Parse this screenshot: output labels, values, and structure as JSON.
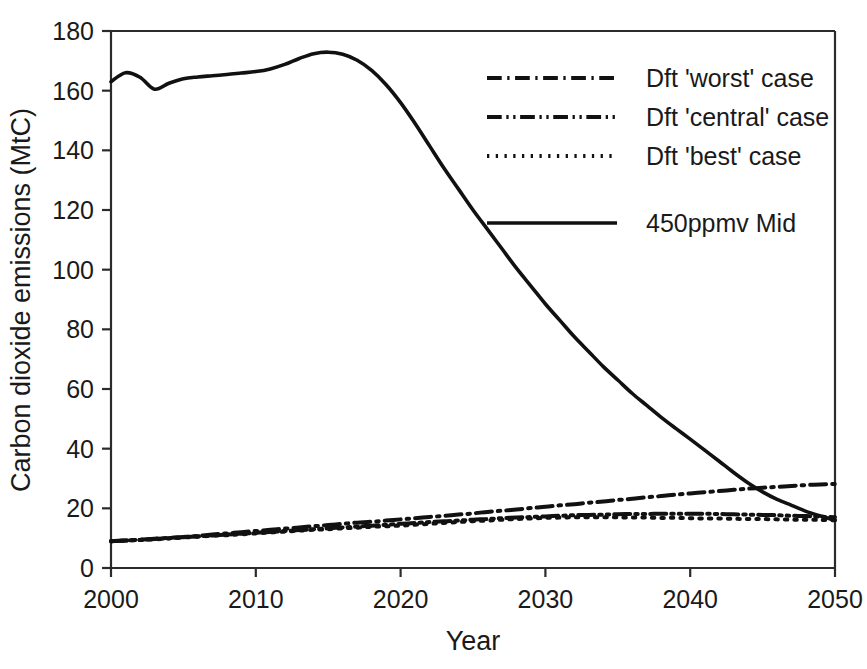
{
  "chart_data": {
    "type": "line",
    "title": "",
    "xlabel": "Year",
    "ylabel": "Carbon dioxide emissions (MtC)",
    "xlim": [
      2000,
      2050
    ],
    "ylim": [
      0,
      180
    ],
    "xticks": [
      2000,
      2010,
      2020,
      2030,
      2040,
      2050
    ],
    "xtick_labels": [
      "2000",
      "2010",
      "2020",
      "2030",
      "2040",
      "2050"
    ],
    "yticks": [
      0,
      20,
      40,
      60,
      80,
      100,
      120,
      140,
      160,
      180
    ],
    "ytick_labels": [
      "0",
      "20",
      "40",
      "60",
      "80",
      "100",
      "120",
      "140",
      "160",
      "180"
    ],
    "grid": false,
    "legend_position": "upper right",
    "x": [
      2000,
      2001,
      2002,
      2003,
      2004,
      2005,
      2006,
      2007,
      2008,
      2009,
      2010,
      2011,
      2012,
      2013,
      2014,
      2015,
      2016,
      2017,
      2018,
      2019,
      2020,
      2021,
      2022,
      2023,
      2024,
      2025,
      2026,
      2027,
      2028,
      2029,
      2030,
      2031,
      2032,
      2033,
      2034,
      2035,
      2036,
      2037,
      2038,
      2039,
      2040,
      2041,
      2042,
      2043,
      2044,
      2045,
      2046,
      2047,
      2048,
      2049,
      2050
    ],
    "series": [
      {
        "name": "Dft 'worst' case",
        "style": "dash-dot",
        "color": "#111111",
        "values": [
          9.0,
          9.2,
          9.5,
          9.8,
          10.1,
          10.4,
          10.8,
          11.2,
          11.6,
          12.0,
          12.4,
          12.8,
          13.2,
          13.6,
          14.0,
          14.4,
          14.8,
          15.2,
          15.5,
          15.9,
          16.3,
          16.7,
          17.1,
          17.5,
          17.9,
          18.3,
          18.8,
          19.2,
          19.6,
          20.1,
          20.5,
          21.0,
          21.4,
          21.9,
          22.3,
          22.8,
          23.2,
          23.7,
          24.1,
          24.6,
          25.0,
          25.4,
          25.8,
          26.2,
          26.6,
          26.9,
          27.2,
          27.5,
          27.8,
          28.0,
          28.2
        ]
      },
      {
        "name": "Dft 'central' case",
        "style": "dash-dot-dot",
        "color": "#111111",
        "values": [
          9.0,
          9.2,
          9.4,
          9.7,
          10.0,
          10.3,
          10.6,
          10.9,
          11.2,
          11.5,
          11.8,
          12.1,
          12.4,
          12.7,
          13.0,
          13.3,
          13.6,
          13.9,
          14.2,
          14.5,
          14.8,
          15.1,
          15.4,
          15.7,
          15.9,
          16.2,
          16.4,
          16.7,
          16.9,
          17.1,
          17.3,
          17.5,
          17.7,
          17.8,
          17.9,
          18.0,
          18.1,
          18.1,
          18.2,
          18.2,
          18.2,
          18.2,
          18.1,
          18.0,
          17.9,
          17.8,
          17.7,
          17.5,
          17.4,
          17.2,
          17.0
        ]
      },
      {
        "name": "Dft 'best' case",
        "style": "dotted",
        "color": "#111111",
        "values": [
          9.0,
          9.2,
          9.4,
          9.6,
          9.9,
          10.2,
          10.5,
          10.8,
          11.0,
          11.3,
          11.6,
          11.9,
          12.2,
          12.5,
          12.8,
          13.0,
          13.3,
          13.5,
          13.8,
          14.0,
          14.2,
          14.5,
          14.8,
          15.1,
          15.4,
          15.7,
          15.9,
          16.2,
          16.4,
          16.6,
          16.8,
          16.9,
          17.0,
          17.0,
          17.0,
          17.0,
          16.9,
          16.9,
          16.8,
          16.8,
          16.7,
          16.6,
          16.6,
          16.5,
          16.4,
          16.4,
          16.3,
          16.2,
          16.2,
          16.1,
          16.0
        ]
      },
      {
        "name": "450ppmv Mid",
        "style": "solid",
        "color": "#111111",
        "values": [
          163.0,
          166.0,
          164.5,
          160.5,
          162.5,
          164.0,
          164.6,
          165.0,
          165.4,
          165.9,
          166.4,
          167.3,
          168.8,
          170.8,
          172.4,
          172.9,
          172.2,
          170.2,
          166.8,
          162.0,
          156.0,
          149.0,
          141.5,
          134.0,
          127.0,
          120.0,
          113.5,
          107.0,
          100.5,
          94.5,
          88.5,
          83.0,
          77.5,
          72.5,
          67.5,
          63.0,
          58.5,
          54.5,
          50.5,
          46.8,
          43.2,
          39.5,
          35.8,
          32.0,
          28.5,
          25.5,
          23.0,
          21.0,
          19.0,
          17.4,
          16.0
        ]
      }
    ],
    "legend_entries": [
      {
        "label": "Dft 'worst' case",
        "style": "dash-dot"
      },
      {
        "label": "Dft 'central' case",
        "style": "dash-dot-dot"
      },
      {
        "label": "Dft 'best' case",
        "style": "dotted"
      },
      {
        "label": "450ppmv Mid",
        "style": "solid"
      }
    ]
  }
}
